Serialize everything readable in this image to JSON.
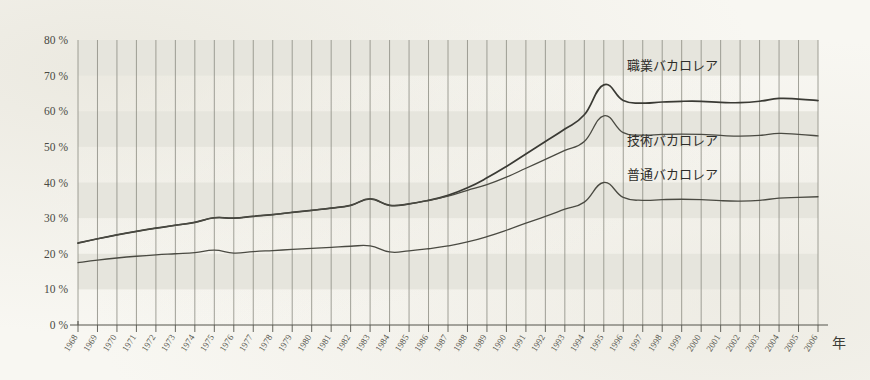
{
  "axis": {
    "x_unit_label": "年",
    "y_tick_labels": [
      "0 %",
      "10 %",
      "20 %",
      "30 %",
      "40 %",
      "50 %",
      "60 %",
      "70 %",
      "80 %"
    ]
  },
  "series_labels": {
    "professional": "職業バカロレア",
    "technical": "技術バカロレア",
    "general": "普通バカロレア"
  },
  "colors": {
    "paper": "#f8f7f2",
    "band": "#e6e5dd",
    "gridline": "#8a8a80",
    "axis": "#55554d",
    "curve_professional": "#3a3a34",
    "curve_technical": "#4a4a42",
    "curve_general": "#4a4a42"
  },
  "chart_data": {
    "type": "line",
    "title": "",
    "xlabel": "年",
    "ylabel": "",
    "xlim": [
      1968,
      2006
    ],
    "ylim": [
      0,
      80
    ],
    "grid": true,
    "y_ticks": [
      0,
      10,
      20,
      30,
      40,
      50,
      60,
      70,
      80
    ],
    "legend_position": "inline-right",
    "x": [
      1968,
      1969,
      1970,
      1971,
      1972,
      1973,
      1974,
      1975,
      1976,
      1977,
      1978,
      1979,
      1980,
      1981,
      1982,
      1983,
      1984,
      1985,
      1986,
      1987,
      1988,
      1989,
      1990,
      1991,
      1992,
      1993,
      1994,
      1995,
      1996,
      1997,
      1998,
      1999,
      2000,
      2001,
      2002,
      2003,
      2004,
      2005,
      2006
    ],
    "x_tick_labels": [
      "1968",
      "1969",
      "1970",
      "1971",
      "1972",
      "1973",
      "1974",
      "1975",
      "1976",
      "1977",
      "1978",
      "1979",
      "1980",
      "1981",
      "1982",
      "1983",
      "1984",
      "1985",
      "1986",
      "1987",
      "1988",
      "1989",
      "1990",
      "1991",
      "1992",
      "1993",
      "1994",
      "1995",
      "1996",
      "1997",
      "1998",
      "1999",
      "2000",
      "2001",
      "2002",
      "2003",
      "2004",
      "2005",
      "2006"
    ],
    "series": [
      {
        "name": "職業バカロレア",
        "label_x": 1996.2,
        "label_y": 71.5,
        "values": [
          23.0,
          24.2,
          25.3,
          26.3,
          27.2,
          28.0,
          28.8,
          30.1,
          30.0,
          30.5,
          31.0,
          31.6,
          32.2,
          32.8,
          33.6,
          35.4,
          33.6,
          34.0,
          35.0,
          36.4,
          38.5,
          41.3,
          44.5,
          48.0,
          51.5,
          55.0,
          59.0,
          67.4,
          63.0,
          62.3,
          62.6,
          62.8,
          62.8,
          62.5,
          62.4,
          62.8,
          63.6,
          63.4,
          63.0
        ]
      },
      {
        "name": "技術バカロレア",
        "label_x": 1996.2,
        "label_y": 50.5,
        "values": [
          23.0,
          24.2,
          25.3,
          26.3,
          27.2,
          28.0,
          28.8,
          30.1,
          30.0,
          30.5,
          31.0,
          31.6,
          32.2,
          32.8,
          33.6,
          35.4,
          33.6,
          34.0,
          35.0,
          36.2,
          37.8,
          39.4,
          41.5,
          44.0,
          46.5,
          49.0,
          51.5,
          58.7,
          54.0,
          53.3,
          53.5,
          53.6,
          53.5,
          53.2,
          53.0,
          53.2,
          53.8,
          53.5,
          53.1
        ]
      },
      {
        "name": "普通バカロレア",
        "label_x": 1996.2,
        "label_y": 41.0,
        "values": [
          17.5,
          18.2,
          18.8,
          19.3,
          19.7,
          20.0,
          20.3,
          21.0,
          20.2,
          20.6,
          20.9,
          21.2,
          21.5,
          21.8,
          22.1,
          22.2,
          20.5,
          20.8,
          21.4,
          22.2,
          23.3,
          24.8,
          26.6,
          28.6,
          30.5,
          32.5,
          34.5,
          40.0,
          35.8,
          35.0,
          35.2,
          35.3,
          35.2,
          34.9,
          34.8,
          35.0,
          35.6,
          35.8,
          36.0
        ]
      }
    ]
  }
}
